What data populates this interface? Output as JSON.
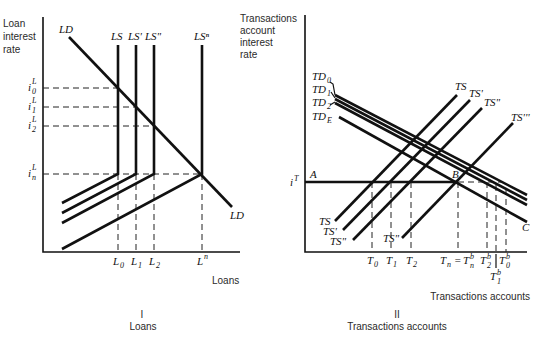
{
  "panel_left": {
    "y_axis_label": [
      "Loan",
      "interest",
      "rate"
    ],
    "x_axis_label": "Loans",
    "caption_numeral": "I",
    "caption_title": "Loans",
    "curves": {
      "demand": "LD",
      "supply": [
        "LS",
        "LS'",
        "LS\"",
        "LSⁿ"
      ]
    },
    "rate_labels": [
      {
        "base": "i",
        "sup": "L",
        "sub": "0"
      },
      {
        "base": "i",
        "sup": "L",
        "sub": "1"
      },
      {
        "base": "i",
        "sup": "L",
        "sub": "2"
      },
      {
        "base": "i",
        "sup": "L",
        "sub": "n"
      }
    ],
    "quantity_labels": [
      {
        "base": "L",
        "sub": "0"
      },
      {
        "base": "L",
        "sub": "1"
      },
      {
        "base": "L",
        "sub": "2"
      },
      {
        "base": "L",
        "sup": "n"
      }
    ]
  },
  "panel_right": {
    "y_axis_label": [
      "Transactions",
      "account",
      "interest",
      "rate"
    ],
    "x_axis_label": "Transactions accounts",
    "caption_numeral": "II",
    "caption_title": "Transactions accounts",
    "rate_label": {
      "base": "i",
      "sup": "T"
    },
    "points": {
      "A": "A",
      "B": "B",
      "C": "C"
    },
    "demand_curves": [
      {
        "base": "TD",
        "sub": "0"
      },
      {
        "base": "TD",
        "sub": "1"
      },
      {
        "base": "TD",
        "sub": "2"
      },
      {
        "base": "TD",
        "sub": "E"
      }
    ],
    "supply_curves": [
      "TS",
      "TS'",
      "TS\"",
      "TS'''"
    ],
    "lower_supply_labels": [
      "TS",
      "TS'",
      "TS\"",
      "TS\""
    ],
    "quantity_labels": [
      {
        "base": "T",
        "sub": "0"
      },
      {
        "base": "T",
        "sub": "1"
      },
      {
        "base": "T",
        "sub": "2"
      },
      {
        "text": "T",
        "sub": "n",
        "eq": "=",
        "base2": "T",
        "sup2": "b",
        "sub2": "n"
      },
      {
        "base": "T",
        "sup": "b",
        "sub": "2"
      },
      {
        "base": "T",
        "sup": "b",
        "sub": "1"
      },
      {
        "base": "T",
        "sup": "b",
        "sub": "0"
      }
    ]
  }
}
